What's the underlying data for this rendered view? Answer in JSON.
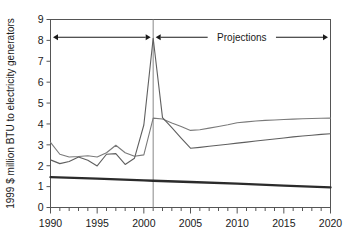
{
  "chart_data": {
    "type": "line",
    "title": "",
    "xlabel": "",
    "ylabel": "1999 $ million BTU to electricity generators",
    "xlim": [
      1990,
      2020
    ],
    "ylim": [
      0,
      9
    ],
    "grid": false,
    "legend_position": "none",
    "x_tick_labels": [
      "1990",
      "1995",
      "2000",
      "2005",
      "2010",
      "2015",
      "2020"
    ],
    "x_tick_values": [
      1990,
      1995,
      2000,
      2005,
      2010,
      2015,
      2020
    ],
    "x_minor_tick_step": 1,
    "y_tick_labels": [
      "0",
      "1",
      "2",
      "3",
      "4",
      "5",
      "6",
      "7",
      "8",
      "9"
    ],
    "y_tick_values": [
      0,
      1,
      2,
      3,
      4,
      5,
      6,
      7,
      8,
      9
    ],
    "history_projection_divider_x": 2001,
    "annotations": [
      {
        "name": "history-span-arrow",
        "label": "",
        "x_start": 1990,
        "x_end": 2001,
        "y": 8.15,
        "style": "double-arrow"
      },
      {
        "name": "projections-span-arrow",
        "label": "Projections",
        "x_start": 2001,
        "x_end": 2020,
        "y": 8.15,
        "style": "double-arrow"
      }
    ],
    "series": [
      {
        "name": "series-upper-gray",
        "color": "#7a7a7a",
        "width": 1.1,
        "x": [
          1990,
          1991,
          1992,
          1993,
          1994,
          1995,
          1996,
          1997,
          1998,
          1999,
          2000,
          2001,
          2002,
          2003,
          2004,
          2005,
          2006,
          2007,
          2008,
          2009,
          2010,
          2011,
          2012,
          2013,
          2014,
          2015,
          2016,
          2017,
          2018,
          2019,
          2020
        ],
        "values": [
          3.12,
          2.55,
          2.42,
          2.44,
          2.48,
          2.42,
          2.62,
          2.98,
          2.62,
          2.45,
          2.52,
          4.28,
          4.24,
          4.05,
          3.88,
          3.69,
          3.72,
          3.8,
          3.88,
          3.96,
          4.06,
          4.1,
          4.14,
          4.17,
          4.19,
          4.21,
          4.23,
          4.25,
          4.26,
          4.27,
          4.28
        ]
      },
      {
        "name": "series-peak-gray",
        "color": "#5f5f5f",
        "width": 1.1,
        "x": [
          1990,
          1991,
          1992,
          1993,
          1994,
          1995,
          1996,
          1997,
          1998,
          1999,
          2000,
          2001,
          2002,
          2003,
          2004,
          2005,
          2006,
          2007,
          2008,
          2009,
          2010,
          2011,
          2012,
          2013,
          2014,
          2015,
          2016,
          2017,
          2018,
          2019,
          2020
        ],
        "values": [
          2.28,
          2.1,
          2.2,
          2.42,
          2.26,
          1.99,
          2.55,
          2.58,
          2.06,
          2.36,
          3.95,
          8.1,
          4.3,
          3.82,
          3.32,
          2.84,
          2.88,
          2.93,
          2.98,
          3.03,
          3.08,
          3.13,
          3.18,
          3.23,
          3.28,
          3.33,
          3.38,
          3.42,
          3.46,
          3.5,
          3.53
        ]
      },
      {
        "name": "series-thick-dark",
        "color": "#2b2b2b",
        "width": 2.3,
        "x": [
          1990,
          1995,
          2000,
          2001,
          2005,
          2010,
          2015,
          2020
        ],
        "values": [
          1.45,
          1.38,
          1.3,
          1.28,
          1.22,
          1.14,
          1.05,
          0.96
        ]
      }
    ]
  }
}
